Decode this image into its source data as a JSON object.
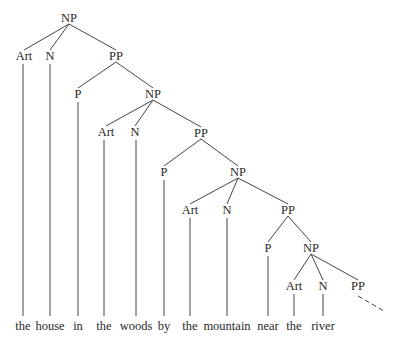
{
  "diagram": {
    "type": "syntax-tree",
    "nodes": [
      {
        "id": "np1",
        "label": "NP",
        "x": 69,
        "y": 18
      },
      {
        "id": "art1",
        "label": "Art",
        "x": 24,
        "y": 56
      },
      {
        "id": "n1",
        "label": "N",
        "x": 50,
        "y": 56
      },
      {
        "id": "pp1",
        "label": "PP",
        "x": 116,
        "y": 56
      },
      {
        "id": "p1",
        "label": "P",
        "x": 78,
        "y": 94
      },
      {
        "id": "np2",
        "label": "NP",
        "x": 153,
        "y": 94
      },
      {
        "id": "art2",
        "label": "Art",
        "x": 106,
        "y": 132
      },
      {
        "id": "n2",
        "label": "N",
        "x": 135,
        "y": 132
      },
      {
        "id": "pp2",
        "label": "PP",
        "x": 201,
        "y": 133
      },
      {
        "id": "p2",
        "label": "P",
        "x": 164,
        "y": 172
      },
      {
        "id": "np3",
        "label": "NP",
        "x": 238,
        "y": 172
      },
      {
        "id": "art3",
        "label": "Art",
        "x": 190,
        "y": 210
      },
      {
        "id": "n3",
        "label": "N",
        "x": 227,
        "y": 210
      },
      {
        "id": "pp3",
        "label": "PP",
        "x": 288,
        "y": 210
      },
      {
        "id": "p3",
        "label": "P",
        "x": 268,
        "y": 248
      },
      {
        "id": "np4",
        "label": "NP",
        "x": 311,
        "y": 248
      },
      {
        "id": "art4",
        "label": "Art",
        "x": 294,
        "y": 286
      },
      {
        "id": "n4",
        "label": "N",
        "x": 323,
        "y": 286
      },
      {
        "id": "pp4",
        "label": "PP",
        "x": 358,
        "y": 286
      }
    ],
    "words": [
      {
        "text": "the",
        "x": 23
      },
      {
        "text": "house",
        "x": 50
      },
      {
        "text": "in",
        "x": 78
      },
      {
        "text": "the",
        "x": 104
      },
      {
        "text": "woods",
        "x": 136
      },
      {
        "text": "by",
        "x": 164
      },
      {
        "text": "the",
        "x": 190
      },
      {
        "text": "mountain",
        "x": 227
      },
      {
        "text": "near",
        "x": 268
      },
      {
        "text": "the",
        "x": 294
      },
      {
        "text": "river",
        "x": 323
      }
    ]
  }
}
